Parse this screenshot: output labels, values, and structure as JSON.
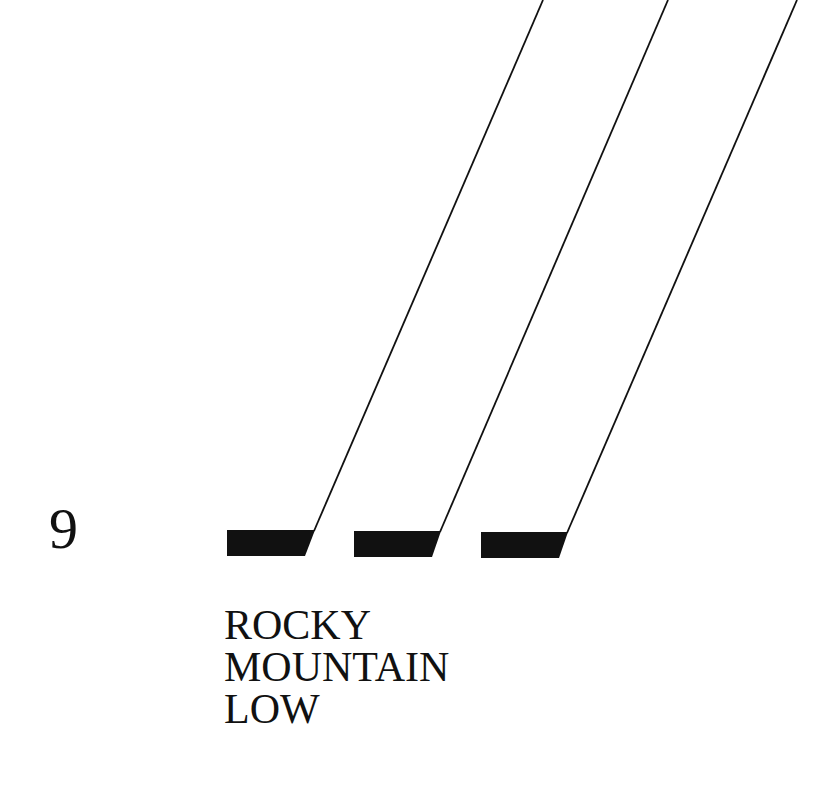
{
  "number": "9",
  "label_lines": [
    "ROCKY",
    "MOUNTAIN",
    "LOW"
  ],
  "colors": {
    "ink": "#111111",
    "background": "#ffffff"
  },
  "graphic": {
    "description": "three skewed black bars with diagonal lines rising to top-right",
    "bars": [
      {
        "top_left": [
          227,
          530
        ],
        "top_right": [
          315,
          530
        ],
        "bottom_right": [
          305,
          556
        ],
        "bottom_left": [
          227,
          556
        ],
        "line_end": [
          543,
          0
        ]
      },
      {
        "top_left": [
          354,
          531
        ],
        "top_right": [
          441,
          531
        ],
        "bottom_right": [
          432,
          557
        ],
        "bottom_left": [
          354,
          557
        ],
        "line_end": [
          668,
          0
        ]
      },
      {
        "top_left": [
          481,
          532
        ],
        "top_right": [
          568,
          532
        ],
        "bottom_right": [
          559,
          558
        ],
        "bottom_left": [
          481,
          558
        ],
        "line_end": [
          797,
          0
        ]
      }
    ]
  }
}
